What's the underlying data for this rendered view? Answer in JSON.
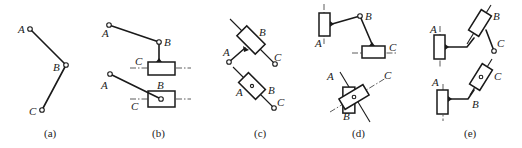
{
  "figure": {
    "panels": [
      {
        "id": "a",
        "caption": "(a)",
        "labels": {
          "A": "A",
          "B": "B",
          "C": "C"
        }
      },
      {
        "id": "b",
        "caption": "(b)",
        "labels": {
          "A1": "A",
          "B1": "B",
          "C1": "C",
          "A2": "A",
          "B2": "B",
          "C2": "C"
        }
      },
      {
        "id": "c",
        "caption": "(c)",
        "labels": {
          "A1": "A",
          "B1": "B",
          "C1": "C",
          "A2": "A",
          "B2": "B",
          "C2": "C"
        }
      },
      {
        "id": "d",
        "caption": "(d)",
        "labels": {
          "A1": "A",
          "B1": "B",
          "C1": "C",
          "A2": "A",
          "B2": "B",
          "C2": "C"
        }
      },
      {
        "id": "e",
        "caption": "(e)",
        "labels": {
          "A1": "A",
          "B1": "B",
          "C1": "C",
          "A2": "A",
          "B2": "B",
          "C2": "C"
        }
      }
    ]
  }
}
